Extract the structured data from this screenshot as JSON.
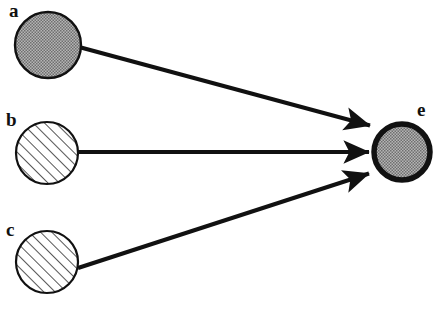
{
  "diagram": {
    "canvas": {
      "width": 436,
      "height": 315,
      "background": "#ffffff"
    },
    "colors": {
      "stroke": "#111111",
      "stipple_fill": "#9a9a9a",
      "hatch_fill": "#ffffff",
      "hatch_line": "#2b2b2b",
      "label_text": "#111111"
    },
    "nodes": [
      {
        "id": "a",
        "label": "a",
        "fill_style": "stipple",
        "cx": 48,
        "cy": 45,
        "r": 33,
        "border_width": 2,
        "label_x": 9,
        "label_y": 17
      },
      {
        "id": "b",
        "label": "b",
        "fill_style": "hatch",
        "cx": 47,
        "cy": 153,
        "r": 31,
        "border_width": 2,
        "label_x": 6,
        "label_y": 126
      },
      {
        "id": "c",
        "label": "c",
        "fill_style": "hatch",
        "cx": 47,
        "cy": 262,
        "r": 31,
        "border_width": 2,
        "label_x": 6,
        "label_y": 236
      },
      {
        "id": "e",
        "label": "e",
        "fill_style": "stipple",
        "cx": 402,
        "cy": 152,
        "r": 29,
        "border_width": 5,
        "label_x": 416,
        "label_y": 116
      }
    ],
    "edges": [
      {
        "id": "a-to-e",
        "from": "a",
        "to": "e",
        "x1": 79,
        "y1": 47,
        "x2": 374,
        "y2": 127,
        "width": 4,
        "arrowhead": "solid-triangle"
      },
      {
        "id": "b-to-e",
        "from": "b",
        "to": "e",
        "x1": 78,
        "y1": 152,
        "x2": 373,
        "y2": 152,
        "width": 4,
        "arrowhead": "solid-triangle"
      },
      {
        "id": "c-to-e",
        "from": "c",
        "to": "e",
        "x1": 78,
        "y1": 268,
        "x2": 373,
        "y2": 172,
        "width": 4,
        "arrowhead": "solid-triangle"
      }
    ]
  }
}
